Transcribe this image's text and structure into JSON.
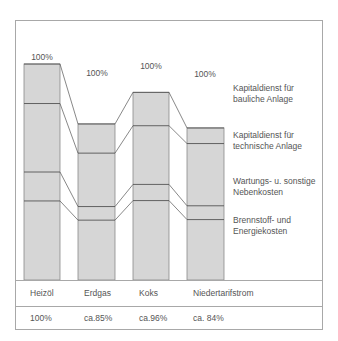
{
  "chart_data": {
    "type": "bar",
    "stacked": true,
    "title": "",
    "xlabel": "",
    "ylabel": "",
    "categories": [
      "Heizöl",
      "Erdgas",
      "Koks",
      "Niedertarifstrom"
    ],
    "totals_label": [
      "100%",
      "100%",
      "100%",
      "100%"
    ],
    "relative_totals": [
      "100%",
      "ca.85%",
      "ca.96%",
      "ca. 84%"
    ],
    "relative_totals_numeric": [
      100,
      85,
      96,
      84
    ],
    "series": [
      {
        "name": "Brennstoff- und Energiekosten",
        "values": [
          36.6,
          32.6,
          38.3,
          33.3
        ]
      },
      {
        "name": "Wartungs- u. sonstige Nebenkosten",
        "values": [
          13.4,
          7.4,
          7.8,
          7.6
        ]
      },
      {
        "name": "Kapitaldienst für technische Anlage",
        "values": [
          31.7,
          29.1,
          28.3,
          34.3
        ]
      },
      {
        "name": "Kapitaldienst für bauliche Anlage",
        "values": [
          18.3,
          15.9,
          16.1,
          8.6
        ]
      }
    ],
    "legend_position": "right",
    "grid": false,
    "colors": {
      "bar_fill": "#d6d6d6",
      "bar_edge": "#8a8a8a",
      "divider": "#555555",
      "connector": "#555555",
      "frame": "#a8a8a8"
    }
  },
  "labels": {
    "bar_tops": [
      "100%",
      "100%",
      "100%",
      "100%"
    ],
    "legend": [
      {
        "line1": "Kapitaldienst für",
        "line2": "bauliche Anlage"
      },
      {
        "line1": "Kapitaldienst für",
        "line2": "technische Anlage"
      },
      {
        "line1": "Wartungs- u. sonstige",
        "line2": "Nebenkosten"
      },
      {
        "line1": "Brennstoff- und",
        "line2": "Energiekosten"
      }
    ],
    "categories": [
      "Heizöl",
      "Erdgas",
      "Koks",
      "Niedertarifstrom"
    ],
    "values": [
      "100%",
      "ca.85%",
      "ca.96%",
      "ca. 84%"
    ]
  }
}
